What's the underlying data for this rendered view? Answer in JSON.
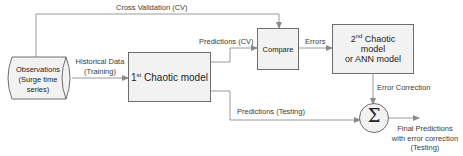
{
  "diagram": {
    "nodes": {
      "observations": {
        "line1": "Observations",
        "line2": "(Surge time",
        "line3": "series)"
      },
      "first_model": {
        "ordinal": "1",
        "ordinal_sup": "st",
        "label": " Chaotic model"
      },
      "compare": {
        "label": "Compare"
      },
      "second_model": {
        "ordinal": "2",
        "ordinal_sup": "nd",
        "line1_rest": " Chaotic",
        "line2": "model",
        "line3": "or ANN model"
      },
      "sum": {
        "symbol": "Σ"
      }
    },
    "edges": {
      "cross_validation": "Cross Validation (CV)",
      "historical_line1": "Historical Data",
      "historical_line2": "(Training)",
      "predictions_cv": "Predictions (CV)",
      "errors": "Errors",
      "predictions_testing": "Predictions (Testing)",
      "error_correction": "Error Correction",
      "final_line1": "Final Predictions",
      "final_line2": "with error correction",
      "final_line3": "(Testing)"
    },
    "colors": {
      "box_fill": "#f2f2f2",
      "box_border": "#6e6e6e",
      "line": "#9a9a9a",
      "text": "#222222"
    }
  }
}
